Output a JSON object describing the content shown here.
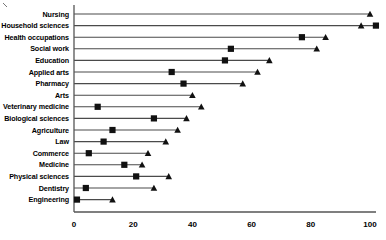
{
  "chart": {
    "title": "",
    "xlabel": "",
    "ylabel": ""
  },
  "chart_data": {
    "type": "bar",
    "subtype": "dumbbell-range",
    "title": "",
    "xlabel": "",
    "ylabel": "",
    "xlim": [
      0,
      104
    ],
    "grid": false,
    "legend": "none",
    "axis_ticks": [
      0,
      20,
      40,
      60,
      80,
      100
    ],
    "tick_labels": [
      "0",
      "20",
      "40",
      "60",
      "80",
      "100"
    ],
    "categories": [
      "Nursing",
      "Household sciences",
      "Health occupations",
      "Social work",
      "Education",
      "Applied arts",
      "Pharmacy",
      "Arts",
      "Veterinary medicine",
      "Biological sciences",
      "Agriculture",
      "Law",
      "Commerce",
      "Medicine",
      "Physical sciences",
      "Dentistry",
      "Engineering"
    ],
    "series": [
      {
        "name": "square-marker",
        "marker": "square",
        "values": [
          null,
          102,
          77,
          53,
          51,
          33,
          37,
          null,
          8,
          27,
          13,
          10,
          5,
          17,
          21,
          4,
          1
        ]
      },
      {
        "name": "triangle-marker",
        "marker": "triangle",
        "values": [
          100,
          97,
          85,
          82,
          66,
          62,
          57,
          40,
          43,
          38,
          35,
          31,
          25,
          23,
          32,
          27,
          13
        ]
      }
    ],
    "rows": [
      {
        "category": "Nursing",
        "square": null,
        "triangle": 100
      },
      {
        "category": "Household sciences",
        "square": 102,
        "triangle": 97
      },
      {
        "category": "Health occupations",
        "square": 77,
        "triangle": 85
      },
      {
        "category": "Social work",
        "square": 53,
        "triangle": 82
      },
      {
        "category": "Education",
        "square": 51,
        "triangle": 66
      },
      {
        "category": "Applied arts",
        "square": 33,
        "triangle": 62
      },
      {
        "category": "Pharmacy",
        "square": 37,
        "triangle": 57
      },
      {
        "category": "Arts",
        "square": null,
        "triangle": 40
      },
      {
        "category": "Veterinary medicine",
        "square": 8,
        "triangle": 43
      },
      {
        "category": "Biological sciences",
        "square": 27,
        "triangle": 38
      },
      {
        "category": "Agriculture",
        "square": 13,
        "triangle": 35
      },
      {
        "category": "Law",
        "square": 10,
        "triangle": 31
      },
      {
        "category": "Commerce",
        "square": 5,
        "triangle": 25
      },
      {
        "category": "Medicine",
        "square": 17,
        "triangle": 23
      },
      {
        "category": "Physical sciences",
        "square": 21,
        "triangle": 32
      },
      {
        "category": "Dentistry",
        "square": 4,
        "triangle": 27
      },
      {
        "category": "Engineering",
        "square": 1,
        "triangle": 13
      }
    ],
    "colors": {
      "marker": "#111111",
      "line": "#4a4a4a",
      "axis": "#555555",
      "text": "#000000",
      "background": "#ffffff"
    }
  }
}
